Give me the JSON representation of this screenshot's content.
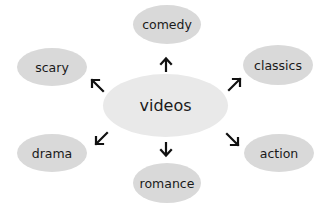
{
  "diagram": {
    "type": "mind-map",
    "center": {
      "label": "videos"
    },
    "nodes": [
      {
        "id": "comedy",
        "label": "comedy",
        "direction": "up"
      },
      {
        "id": "classics",
        "label": "classics",
        "direction": "up-right"
      },
      {
        "id": "action",
        "label": "action",
        "direction": "down-right"
      },
      {
        "id": "romance",
        "label": "romance",
        "direction": "down"
      },
      {
        "id": "drama",
        "label": "drama",
        "direction": "down-left"
      },
      {
        "id": "scary",
        "label": "scary",
        "direction": "up-left"
      }
    ],
    "colors": {
      "node_fill": "#d9d9d9",
      "center_fill": "#e9e9e9",
      "arrow": "#111111",
      "text": "#1a1a1a"
    }
  }
}
